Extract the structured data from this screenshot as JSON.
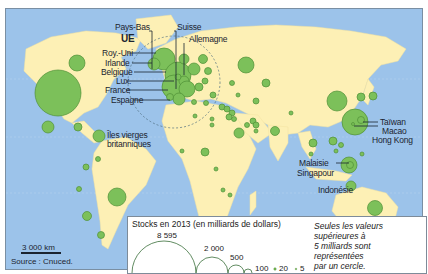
{
  "map": {
    "labels": {
      "pays_bas": "Pays-Bas",
      "suisse": "Suisse",
      "ue": "UE",
      "allemagne": "Allemagne",
      "roy_uni": "Roy.-Uni",
      "irlande": "Irlande",
      "belgique": "Belgique",
      "lux": "Lux.",
      "france": "France",
      "espagne": "Espagne",
      "iles_vierges_1": "Îles vierges",
      "iles_vierges_2": "britanniques",
      "taiwan": "Taïwan",
      "macao": "Macao",
      "hong_kong": "Hong Kong",
      "malaisie": "Malaisie",
      "singapour": "Singapour",
      "indonesie": "Indonésie"
    },
    "colors": {
      "ocean": "#9cc3ea",
      "land": "#fdf0b5",
      "circle_fill": "#7cc05a",
      "circle_stroke": "#4f8f37"
    }
  },
  "legend": {
    "title": "Stocks en 2013 (en milliards de dollars)",
    "values": [
      "8 595",
      "2 000",
      "500",
      "100",
      "20",
      "5"
    ],
    "note_lines": [
      "Seules les valeurs",
      "supérieures à",
      "5 milliards sont",
      "représentées",
      "par un cercle."
    ]
  },
  "scale": {
    "label": "3 000 km"
  },
  "source": {
    "label": "Source : Cnuced."
  }
}
